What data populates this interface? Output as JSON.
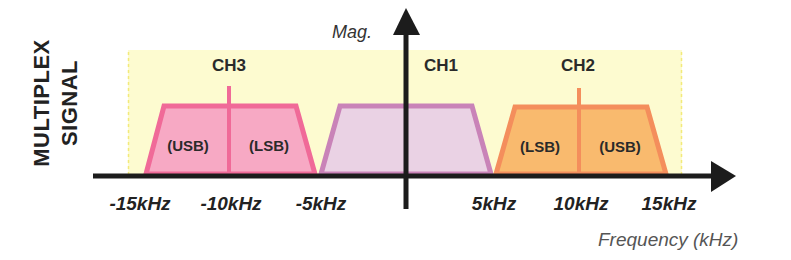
{
  "diagram": {
    "side_label": {
      "line1": "MULTIPLEX",
      "line2": "SIGNAL"
    },
    "y_axis_label": "Mag.",
    "x_axis_label": "Frequency (kHz)",
    "x_ticks": [
      "-15kHz",
      "-10kHz",
      "-5kHz",
      "5kHz",
      "10kHz",
      "15kHz"
    ],
    "channels": [
      {
        "name": "CH3",
        "left_band": "(USB)",
        "right_band": "(LSB)",
        "fill": "#f7a9c4",
        "stroke": "#f06a98",
        "center_khz": -10
      },
      {
        "name": "CH1",
        "fill": "#ead2e4",
        "stroke": "#c983b8",
        "center_khz": 0
      },
      {
        "name": "CH2",
        "left_band": "(LSB)",
        "right_band": "(USB)",
        "fill": "#f9ba6e",
        "stroke": "#f48e5c",
        "center_khz": 10
      }
    ],
    "background_color": "#fdfbd0"
  }
}
